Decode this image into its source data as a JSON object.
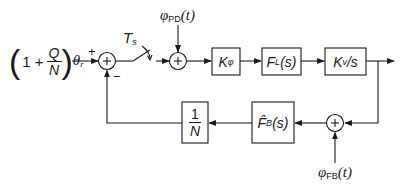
{
  "diagram": {
    "type": "control-loop-block-diagram",
    "input": {
      "paren_open": "(",
      "one": "1 +",
      "frac_num": "Q",
      "frac_den": "N",
      "paren_close": ")",
      "theta": "θ",
      "theta_sub": "r"
    },
    "junction1": {
      "plus_sign": "+",
      "minus_sign": "−",
      "symbol": "+"
    },
    "switch": {
      "label": "T",
      "label_sub": "s"
    },
    "disturbance_pd": {
      "phi": "φ",
      "sub": "PD",
      "arg": "(t)"
    },
    "junction2": {
      "symbol": "+"
    },
    "blocks": {
      "k_phi": {
        "main": "K",
        "sub": "φ"
      },
      "f_l": {
        "main": "F",
        "sub": "L",
        "arg": "(s)"
      },
      "kv_s": {
        "main": "K",
        "sub": "v",
        "rest": "/s"
      },
      "f_b": {
        "main": "F̂",
        "sub": "B",
        "arg": "(s)"
      },
      "inv_n": {
        "num": "1",
        "den": "N"
      }
    },
    "junction3": {
      "symbol": "+"
    },
    "disturbance_fb": {
      "phi": "φ",
      "sub": "FB",
      "arg": "(t)"
    },
    "colors": {
      "stroke": "#1a1a1a",
      "background": "#ffffff"
    }
  }
}
